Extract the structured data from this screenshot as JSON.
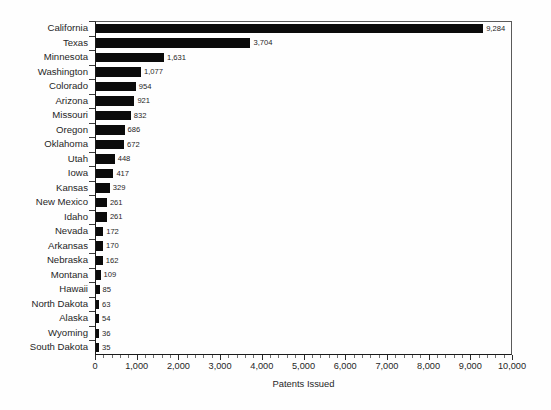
{
  "chart_data": {
    "type": "bar",
    "orientation": "horizontal",
    "title": "",
    "xlabel": "Patents Issued",
    "ylabel": "",
    "xlim": [
      0,
      10000
    ],
    "grid": false,
    "legend": null,
    "x_tick_labels": [
      "0",
      "1,000",
      "2,000",
      "3,000",
      "4,000",
      "5,000",
      "6,000",
      "7,000",
      "8,000",
      "9,000",
      "10,000"
    ],
    "x_tick_values": [
      0,
      1000,
      2000,
      3000,
      4000,
      5000,
      6000,
      7000,
      8000,
      9000,
      10000
    ],
    "x_minor_tick_interval": 200,
    "bar_color": "#0b0b0b",
    "categories": [
      "California",
      "Texas",
      "Minnesota",
      "Washington",
      "Colorado",
      "Arizona",
      "Missouri",
      "Oregon",
      "Oklahoma",
      "Utah",
      "Iowa",
      "Kansas",
      "New Mexico",
      "Idaho",
      "Nevada",
      "Arkansas",
      "Nebraska",
      "Montana",
      "Hawaii",
      "North Dakota",
      "Alaska",
      "Wyoming",
      "South Dakota"
    ],
    "values": [
      9284,
      3704,
      1631,
      1077,
      954,
      921,
      832,
      686,
      672,
      448,
      417,
      329,
      261,
      261,
      172,
      170,
      162,
      109,
      85,
      63,
      54,
      36,
      35
    ],
    "value_labels": [
      "9,284",
      "3,704",
      "1,631",
      "1,077",
      "954",
      "921",
      "832",
      "686",
      "672",
      "448",
      "417",
      "329",
      "261",
      "261",
      "172",
      "170",
      "162",
      "109",
      "85",
      "63",
      "54",
      "36",
      "35"
    ]
  }
}
